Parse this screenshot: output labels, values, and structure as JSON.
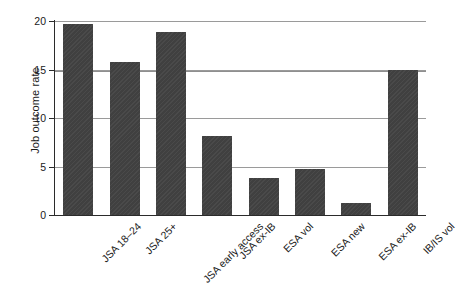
{
  "chart_data": {
    "type": "bar",
    "title": "",
    "subtitle": "",
    "xlabel": "",
    "ylabel": "Job outcome rate",
    "categories": [
      "JSA 18–24",
      "JSA 25+",
      "JSA early access",
      "JSA ex-IB",
      "ESA vol",
      "ESA new",
      "ESA ex-IB",
      "IB/IS vol"
    ],
    "values": [
      19.7,
      15.8,
      18.9,
      8.1,
      3.8,
      4.7,
      1.2,
      15.0
    ],
    "ylim": [
      0,
      20
    ],
    "yticks": [
      0,
      5,
      10,
      15,
      20
    ],
    "ytick_labels": [
      "0",
      "5",
      "10",
      "15",
      "20"
    ],
    "gridlines": [
      5,
      10,
      15,
      20
    ],
    "reference_line": 14.8,
    "grid": true,
    "legend": "none",
    "bar_color": "#404040",
    "grid_color": "#9a9a9a",
    "axis_color": "#2b2b2b",
    "background_color": "#ffffff"
  }
}
